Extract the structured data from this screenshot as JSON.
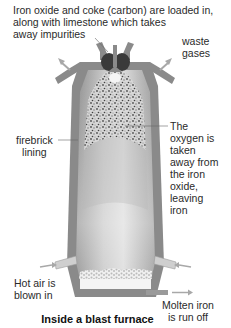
{
  "diagram": {
    "title": "Inside a blast furnace",
    "labels": {
      "top_line1": "Iron oxide and coke (carbon) are loaded in,",
      "top_line2": "along with limestone which takes",
      "top_line3": "away impurities",
      "waste_line1": "waste",
      "waste_line2": "gases",
      "firebrick_line1": "firebrick",
      "firebrick_line2": "lining",
      "oxygen_line1": "The",
      "oxygen_line2": "oxygen is",
      "oxygen_line3": "taken",
      "oxygen_line4": "away from",
      "oxygen_line5": "the iron",
      "oxygen_line6": "oxide,",
      "oxygen_line7": "leaving",
      "oxygen_line8": "iron",
      "hotair_line1": "Hot air is",
      "hotair_line2": "blown in",
      "molten_line1": "Molten iron",
      "molten_line2": "is run off"
    },
    "colors": {
      "wall": "#8a8a8a",
      "wall_dark": "#6f6f6f",
      "interior_light": "#e4e4e4",
      "interior_dark": "#9a9a9a",
      "charge": "#3a3a3a",
      "arrow": "#a8a8a8"
    }
  }
}
